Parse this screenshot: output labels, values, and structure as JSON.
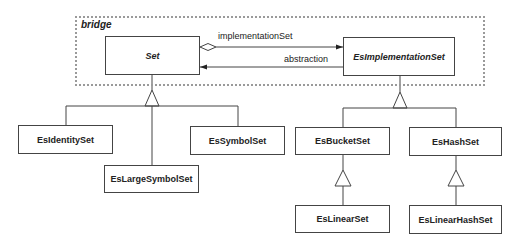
{
  "package": {
    "label": "bridge"
  },
  "classes": {
    "set": {
      "name": "Set"
    },
    "implementation": {
      "name": "EsImplementationSet"
    },
    "identity": {
      "name": "EsIdentitySet"
    },
    "large_symbol": {
      "name": "EsLargeSymbolSet"
    },
    "symbol": {
      "name": "EsSymbolSet"
    },
    "bucket": {
      "name": "EsBucketSet"
    },
    "hash": {
      "name": "EsHashSet"
    },
    "linear": {
      "name": "EsLinearSet"
    },
    "linear_hash": {
      "name": "EsLinearHashSet"
    }
  },
  "associations": {
    "implementation_set": {
      "label": "implementationSet"
    },
    "abstraction": {
      "label": "abstraction"
    }
  }
}
